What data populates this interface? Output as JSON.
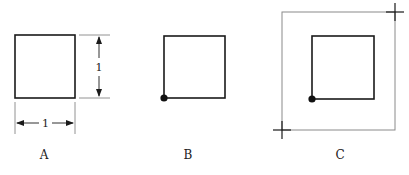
{
  "figures": [
    {
      "id": "A",
      "label": "A",
      "width_label": "1",
      "height_label": "1"
    },
    {
      "id": "B",
      "label": "B"
    },
    {
      "id": "C",
      "label": "C"
    }
  ],
  "colors": {
    "stroke": "#1a1a1a",
    "outer_frame": "#8a8a8a",
    "background": "#ffffff"
  }
}
